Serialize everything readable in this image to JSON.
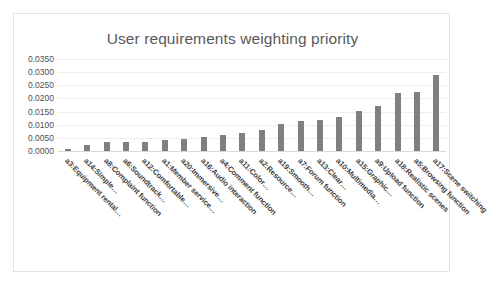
{
  "chart": {
    "title": "User requirements weighting priority",
    "frame_border_color": "#e2e2e2",
    "bar_color": "#808080",
    "gridline_color": "#ededed"
  },
  "chart_data": {
    "type": "bar",
    "title": "User requirements weighting priority",
    "xlabel": "",
    "ylabel": "",
    "ylim": [
      0.0,
      0.035
    ],
    "ytick_step": 0.005,
    "grid": "horizontal",
    "legend": "none",
    "orientation": "vertical",
    "ytick_labels": [
      "0.0000",
      "0.0050",
      "0.0100",
      "0.0150",
      "0.0200",
      "0.0250",
      "0.0300",
      "0.0350"
    ],
    "categories": [
      "a3:Equipment rental…",
      "a14:Simple…",
      "a8:Complaint function",
      "a6:Soundtrack…",
      "a12:Comfortable…",
      "a1:Member service…",
      "a20:Immersive…",
      "a16:Audio interaction",
      "a4:Comment function",
      "a11:Color…",
      "a2:Resource…",
      "a19:Smooth…",
      "a7:Forum function",
      "a13:Clear…",
      "a10:Multimedia…",
      "a15:Graphic…",
      "a9:Upload function",
      "a18:Realistic scenes",
      "a5:Browsing function",
      "a17:Scene switching"
    ],
    "values": [
      0.0008,
      0.0021,
      0.0033,
      0.0034,
      0.0036,
      0.0041,
      0.0047,
      0.0054,
      0.0062,
      0.0068,
      0.0079,
      0.0101,
      0.0114,
      0.0119,
      0.013,
      0.0153,
      0.0173,
      0.0221,
      0.0223,
      0.029
    ]
  }
}
